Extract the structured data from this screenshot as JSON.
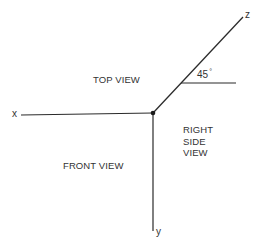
{
  "diagram": {
    "type": "orthographic-axes",
    "line_color": "#2b2b2b",
    "text_color": "#333333",
    "axes": {
      "x": {
        "label": "x"
      },
      "y": {
        "label": "y"
      },
      "z": {
        "label": "z"
      }
    },
    "angle": {
      "value": "45",
      "unit": "°"
    },
    "regions": {
      "top_view": "TOP VIEW",
      "front_view": "FRONT VIEW",
      "right_side_view": [
        "RIGHT",
        "SIDE",
        "VIEW"
      ]
    }
  }
}
